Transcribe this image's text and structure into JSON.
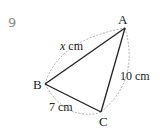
{
  "question": {
    "number": "9"
  },
  "figure": {
    "type": "triangle",
    "vertices": [
      {
        "label": "A",
        "x": 125,
        "y": 28
      },
      {
        "label": "B",
        "x": 45,
        "y": 84
      },
      {
        "label": "C",
        "x": 101,
        "y": 112
      }
    ],
    "sides": [
      {
        "between": "AB",
        "label_var": "x",
        "label_unit": " cm"
      },
      {
        "between": "AC",
        "label": "10 cm"
      },
      {
        "between": "BC",
        "label": "7 cm"
      }
    ],
    "colors": {
      "stroke": "#222222",
      "dashed_arc": "#999999",
      "question_number": "#8a8a8a"
    }
  }
}
